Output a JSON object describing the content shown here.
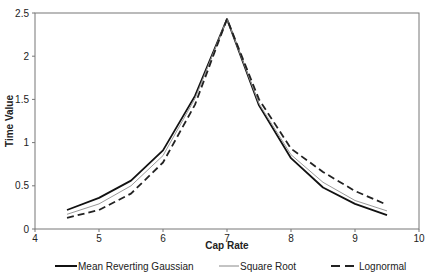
{
  "chart_data": {
    "type": "line",
    "title": "",
    "xlabel": "Cap Rate",
    "ylabel": "Time Value",
    "xlim": [
      4,
      10
    ],
    "ylim": [
      0,
      2.5
    ],
    "xticks": [
      4,
      5,
      6,
      7,
      8,
      9,
      10
    ],
    "yticks": [
      0,
      0.5,
      1,
      1.5,
      2,
      2.5
    ],
    "xtick_labels": [
      "4",
      "5",
      "6",
      "7",
      "8",
      "9",
      "10"
    ],
    "ytick_labels": [
      "0",
      "0.5",
      "1",
      "1.5",
      "2",
      "2.5"
    ],
    "grid": false,
    "legend_position": "bottom",
    "x": [
      4.5,
      5,
      5.5,
      6,
      6.5,
      7,
      7.5,
      8,
      8.5,
      9,
      9.5
    ],
    "series": [
      {
        "name": "Mean Reverting Gaussian",
        "style": "solid-thick",
        "color": "#111111",
        "values": [
          0.22,
          0.36,
          0.56,
          0.91,
          1.54,
          2.43,
          1.43,
          0.82,
          0.48,
          0.29,
          0.16
        ]
      },
      {
        "name": "Square Root",
        "style": "solid-thin",
        "color": "#888888",
        "values": [
          0.17,
          0.29,
          0.5,
          0.85,
          1.51,
          2.43,
          1.45,
          0.86,
          0.54,
          0.33,
          0.21
        ]
      },
      {
        "name": "Lognormal",
        "style": "dashed",
        "color": "#222222",
        "values": [
          0.13,
          0.22,
          0.41,
          0.77,
          1.44,
          2.43,
          1.5,
          0.93,
          0.66,
          0.44,
          0.28
        ]
      }
    ]
  },
  "legend": {
    "items": [
      {
        "label": "Mean Reverting Gaussian"
      },
      {
        "label": "Square Root"
      },
      {
        "label": "Lognormal"
      }
    ]
  },
  "axes": {
    "x_title": "Cap Rate",
    "y_title": "Time Value"
  }
}
